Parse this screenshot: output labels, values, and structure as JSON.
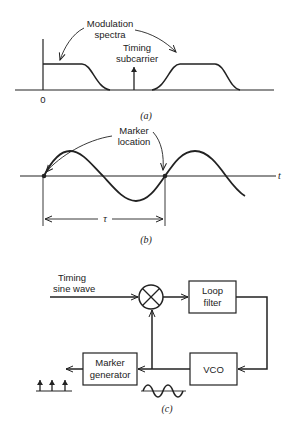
{
  "panel_a": {
    "label_spectra_1": "Modulation",
    "label_spectra_2": "spectra",
    "label_timing_1": "Timing",
    "label_timing_2": "subcarrier",
    "origin_label": "0",
    "caption": "(a)"
  },
  "panel_b": {
    "marker_1": "Marker",
    "marker_2": "location",
    "axis_label": "t",
    "period_label": "τ",
    "caption": "(b)"
  },
  "panel_c": {
    "input_1": "Timing",
    "input_2": "sine wave",
    "loop_filter_1": "Loop",
    "loop_filter_2": "filter",
    "vco": "VCO",
    "marker_gen_1": "Marker",
    "marker_gen_2": "generator",
    "caption": "(c)"
  },
  "colors": {
    "ink": "#222222",
    "background": "#ffffff"
  }
}
